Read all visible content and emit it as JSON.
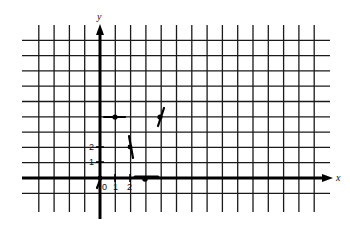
{
  "chart_data": {
    "type": "scatter",
    "title": "",
    "xlabel": "x",
    "ylabel": "y",
    "x_tick_labels": [
      "0",
      "1",
      "2"
    ],
    "y_tick_labels": [
      "1",
      "2"
    ],
    "grid": true,
    "xlim": [
      -4,
      15
    ],
    "ylim": [
      -2,
      10
    ],
    "points": [
      {
        "x": 1,
        "y": 4,
        "slope_segment": "horizontal"
      },
      {
        "x": 2,
        "y": 2,
        "slope_segment": "steep-negative"
      },
      {
        "x": 3,
        "y": 0,
        "slope_segment": "horizontal"
      },
      {
        "x": 4,
        "y": 4,
        "slope_segment": "steep-positive"
      },
      {
        "x": 0,
        "y": 0,
        "slope_segment": "steep-positive"
      }
    ],
    "annotations": "Short tangent/slope segments drawn through plotted points"
  },
  "labels": {
    "x_axis": "x",
    "y_axis": "y",
    "origin": "0",
    "x1": "1",
    "x2": "2",
    "y1": "1",
    "y2": "2"
  }
}
